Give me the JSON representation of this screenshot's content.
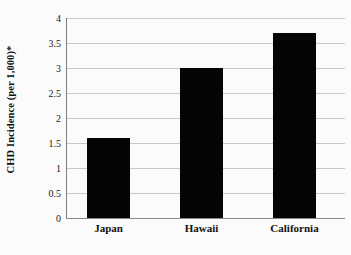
{
  "chart_data": {
    "type": "bar",
    "title": "",
    "subtitle": "",
    "xlabel": "",
    "ylabel": "CHD Incidence (per 1,000)*",
    "categories": [
      "Japan",
      "Hawaii",
      "California"
    ],
    "values": [
      1.6,
      3.0,
      3.7
    ],
    "series": [
      {
        "name": "CHD Incidence",
        "values": [
          1.6,
          3.0,
          3.7
        ],
        "color": "#050505"
      }
    ],
    "ylim": [
      0,
      4
    ],
    "ytick_labels": [
      "4",
      "3.5",
      "3",
      "2.5",
      "2",
      "1.5",
      "1",
      "0.5",
      "0"
    ],
    "ytick_values": [
      4,
      3.5,
      3,
      2.5,
      2,
      1.5,
      1,
      0.5,
      0
    ],
    "grid": true,
    "grid_axis": "y",
    "legend": false,
    "legend_position": "none",
    "annotations": [],
    "bar_color": "#050505",
    "gridline_color": "#c9c9c9",
    "axis_color": "#7d7d7d",
    "background_color": "#fbfbfb"
  }
}
